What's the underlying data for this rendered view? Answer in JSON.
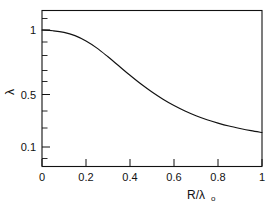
{
  "chart_data": {
    "type": "line",
    "title": "",
    "subtitle": "",
    "xlabel": "R/λₒ",
    "xlabel_main": "R/λ",
    "xlabel_subscript": "o",
    "ylabel": "λ",
    "xscale": "linear",
    "yscale": "log",
    "xlim": [
      0,
      1
    ],
    "ylim": [
      0.08,
      1.2
    ],
    "grid": false,
    "legend": null,
    "legend_position": "none",
    "xticks": [
      0,
      0.2,
      0.4,
      0.6,
      0.8,
      1
    ],
    "xticklabels": [
      "0",
      "0.2",
      "0.4",
      "0.6",
      "0.8",
      "1"
    ],
    "yticks": [
      1,
      0.5,
      0.1
    ],
    "yticklabels": [
      "1",
      "0.5",
      "0.1"
    ],
    "yticks_minor": [
      0.9,
      0.8,
      0.7,
      0.6,
      0.4,
      0.3,
      0.2,
      0.09
    ],
    "line_color": "#111111",
    "frame_color": "#111111",
    "background_color": "#ffffff",
    "series": [
      {
        "name": "lambda",
        "x": [
          0.0,
          0.05,
          0.1,
          0.15,
          0.2,
          0.25,
          0.3,
          0.35,
          0.4,
          0.45,
          0.5,
          0.55,
          0.6,
          0.65,
          0.7,
          0.75,
          0.8,
          0.85,
          0.9,
          0.95,
          1.0
        ],
        "values": [
          1.0,
          0.985,
          0.955,
          0.895,
          0.805,
          0.7,
          0.59,
          0.492,
          0.41,
          0.345,
          0.295,
          0.256,
          0.226,
          0.203,
          0.185,
          0.171,
          0.16,
          0.151,
          0.144,
          0.138,
          0.133
        ]
      }
    ],
    "annotations": []
  },
  "figure": {
    "name": "decay-curve-figure",
    "width": 270,
    "height": 210
  }
}
